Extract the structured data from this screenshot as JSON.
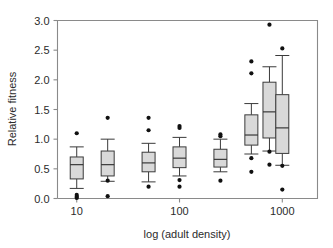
{
  "chart_data": {
    "type": "box",
    "title": "",
    "xlabel": "log (adult density)",
    "ylabel": "Relative fitness",
    "ylim": [
      0.0,
      3.0
    ],
    "yticks": [
      0.0,
      0.5,
      1.0,
      1.5,
      2.0,
      2.5,
      3.0
    ],
    "ytick_labels": [
      "0.0",
      "0.5",
      "1.0",
      "1.5",
      "2.0",
      "2.5",
      "3.0"
    ],
    "xscale": "log",
    "xlim": [
      6.5,
      2200
    ],
    "xticks": [
      10,
      100,
      1000
    ],
    "xtick_labels": [
      "10",
      "100",
      "1000"
    ],
    "grid": false,
    "legend": null,
    "boxes": [
      {
        "x": 10,
        "whisker_low": 0.17,
        "q1": 0.33,
        "median": 0.57,
        "q3": 0.7,
        "whisker_high": 0.87,
        "outliers": [
          1.1,
          0.06,
          0.03,
          0.01
        ]
      },
      {
        "x": 20,
        "whisker_low": 0.29,
        "q1": 0.38,
        "median": 0.57,
        "q3": 0.8,
        "whisker_high": 1.0,
        "outliers": [
          1.36,
          0.3,
          0.04
        ]
      },
      {
        "x": 50,
        "whisker_low": 0.28,
        "q1": 0.45,
        "median": 0.6,
        "q3": 0.78,
        "whisker_high": 0.93,
        "outliers": [
          1.36,
          1.15,
          0.2
        ]
      },
      {
        "x": 100,
        "whisker_low": 0.38,
        "q1": 0.52,
        "median": 0.68,
        "q3": 0.87,
        "whisker_high": 1.03,
        "outliers": [
          1.22,
          1.19,
          0.31,
          0.2
        ]
      },
      {
        "x": 250,
        "whisker_low": 0.45,
        "q1": 0.53,
        "median": 0.66,
        "q3": 0.83,
        "whisker_high": 1.0,
        "outliers": [
          1.08,
          1.05,
          0.3
        ]
      },
      {
        "x": 500,
        "whisker_low": 0.75,
        "q1": 0.9,
        "median": 1.07,
        "q3": 1.41,
        "whisker_high": 1.6,
        "outliers": [
          2.31,
          2.11,
          0.68,
          0.45
        ]
      },
      {
        "x": 750,
        "whisker_low": 0.8,
        "q1": 1.02,
        "median": 1.46,
        "q3": 1.96,
        "whisker_high": 2.22,
        "outliers": [
          2.93,
          0.79,
          0.57
        ]
      },
      {
        "x": 1000,
        "whisker_low": 0.56,
        "q1": 0.76,
        "median": 1.19,
        "q3": 1.75,
        "whisker_high": 2.41,
        "outliers": [
          2.53,
          0.55,
          0.15
        ]
      }
    ]
  },
  "colors": {
    "box_fill": "#d9d9d9",
    "box_stroke": "#3a3a3a",
    "axis": "#8a8a8a",
    "text": "#2b2b2b",
    "outlier": "#111111",
    "background": "#ffffff"
  }
}
